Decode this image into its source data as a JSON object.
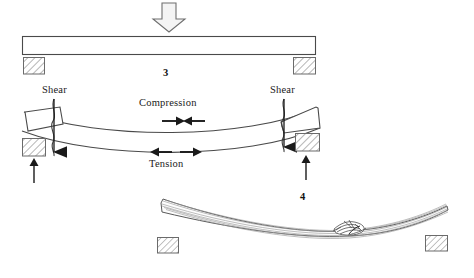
{
  "figure": {
    "title_absent": true,
    "background_color": "#ffffff",
    "line_color": "#3a3a3a",
    "hatch_color": "#6b6b6b",
    "arrow_fill": "#f2f2f2",
    "solid_arrow_color": "#1a1a1a"
  },
  "panels": [
    {
      "id": "panel-3",
      "number": "3",
      "caption_position": {
        "x": 163,
        "y": 70
      },
      "description": "Straight beam on two supports with downward load arrow",
      "elements": {
        "load_arrow": {
          "name": "load-arrow",
          "direction": "down",
          "x": 152,
          "y": 2,
          "w": 33,
          "h": 31
        },
        "beam": {
          "name": "straight-beam",
          "x": 22,
          "y": 36,
          "w": 294,
          "h": 18
        },
        "support_left": {
          "name": "support-block-left",
          "x": 23,
          "y": 57,
          "w": 22,
          "h": 17
        },
        "support_right": {
          "name": "support-block-right",
          "x": 293,
          "y": 57,
          "w": 23,
          "h": 17
        }
      }
    },
    {
      "id": "panel-stress",
      "description": "Bent beam showing shear, compression and tension",
      "labels": {
        "shear_left": "Shear",
        "shear_right": "Shear",
        "compression": "Compression",
        "tension": "Tension"
      },
      "label_positions": {
        "shear_left": {
          "x": 42,
          "y": 85
        },
        "shear_right": {
          "x": 270,
          "y": 85
        },
        "compression": {
          "x": 139,
          "y": 98
        },
        "tension": {
          "x": 148,
          "y": 159
        }
      },
      "elements": {
        "beam_bent": {
          "name": "bent-beam",
          "span_x": [
            22,
            320
          ],
          "sag_px": 22
        },
        "shear_crack_left": {
          "name": "shear-crack-left",
          "x": 53
        },
        "shear_crack_right": {
          "name": "shear-crack-right",
          "x": 284
        },
        "shear_arrow_left": {
          "name": "shear-arrow-left",
          "direction": "down",
          "x": 54,
          "y_top": 100,
          "y_bottom": 163
        },
        "shear_arrow_right": {
          "name": "shear-arrow-right",
          "direction": "down",
          "x": 284,
          "y_top": 100,
          "y_bottom": 158
        },
        "reaction_arrow_left": {
          "name": "reaction-arrow-left",
          "direction": "up",
          "x": 34,
          "y_top": 160,
          "y_bottom": 183
        },
        "reaction_arrow_right": {
          "name": "reaction-arrow-right",
          "direction": "up",
          "x": 306,
          "y_top": 158,
          "y_bottom": 180
        },
        "compression_arrow_left": {
          "name": "compression-arrow-left",
          "direction": "right",
          "x1": 163,
          "x2": 184,
          "y": 121
        },
        "compression_arrow_right": {
          "name": "compression-arrow-right",
          "direction": "left",
          "x1": 204,
          "x2": 183,
          "y": 121
        },
        "tension_arrow_left": {
          "name": "tension-arrow-left",
          "direction": "left",
          "x1": 172,
          "x2": 150,
          "y": 152
        },
        "tension_arrow_right": {
          "name": "tension-arrow-right",
          "direction": "right",
          "x1": 178,
          "x2": 200,
          "y": 152
        },
        "end_block_left": {
          "name": "tilted-end-block-left",
          "x": 25,
          "y": 110
        },
        "end_block_right": {
          "name": "tilted-end-block-right",
          "x": 283,
          "y": 108
        },
        "support_left": {
          "name": "support-block-left",
          "x": 22,
          "y": 138,
          "w": 23,
          "h": 18
        },
        "support_right": {
          "name": "support-block-right",
          "x": 295,
          "y": 133,
          "w": 25,
          "h": 18
        }
      }
    },
    {
      "id": "panel-4",
      "number": "4",
      "caption_position": {
        "x": 300,
        "y": 193
      },
      "description": "Broken timber beam with splintered tension failure on two supports",
      "elements": {
        "timber_beam": {
          "name": "broken-timber-beam",
          "span_x": [
            160,
            448
          ]
        },
        "splinter_break": {
          "name": "splinter-break",
          "x": 340,
          "y": 228
        },
        "support_left": {
          "name": "support-block-left",
          "x": 157,
          "y": 237,
          "w": 22,
          "h": 16
        },
        "support_right": {
          "name": "support-block-right",
          "x": 425,
          "y": 235,
          "w": 23,
          "h": 16
        }
      }
    }
  ]
}
